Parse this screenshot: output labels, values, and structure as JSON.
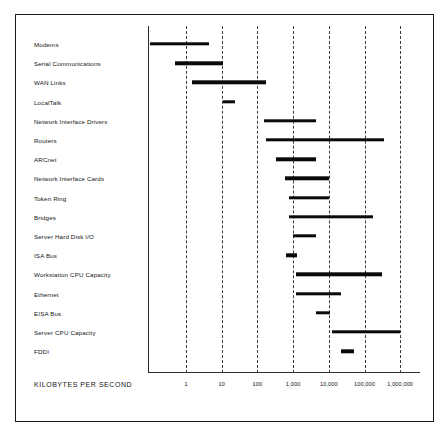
{
  "chart_data": {
    "type": "bar",
    "orientation": "horizontal",
    "subtype": "range-bar",
    "title": "",
    "xlabel": "KILOBYTES PER SECOND",
    "ylabel": "",
    "xscale": "log",
    "xlim": [
      0.1,
      2000000
    ],
    "grid": true,
    "legend": null,
    "xticks": [
      1,
      10,
      100,
      1000,
      10000,
      100000,
      1000000
    ],
    "xtick_labels": [
      "1",
      "10",
      "100",
      "1,000",
      "10,000",
      "100,000",
      "1,000,000"
    ],
    "categories": [
      "Modems",
      "Serial Communications",
      "WAN Links",
      "LocalTalk",
      "Network Interface Drivers",
      "Routers",
      "ARCnet",
      "Network Interface Cards",
      "Token Ring",
      "Bridges",
      "Server Hard Disk I/O",
      "ISA Bus",
      "Workstation CPU Capacity",
      "Ethernet",
      "EISA Bus",
      "Server CPU Capacity",
      "FDDI"
    ],
    "ranges": [
      {
        "category": "Modems",
        "low": 0.1,
        "high": 4.3
      },
      {
        "category": "Serial Communications",
        "low": 0.5,
        "high": 11
      },
      {
        "category": "WAN Links",
        "low": 1.5,
        "high": 170
      },
      {
        "category": "LocalTalk",
        "low": 11,
        "high": 24
      },
      {
        "category": "Network Interface Drivers",
        "low": 150,
        "high": 4500
      },
      {
        "category": "Routers",
        "low": 170,
        "high": 360000
      },
      {
        "category": "ARCnet",
        "low": 330,
        "high": 4500
      },
      {
        "category": "Network Interface Cards",
        "low": 600,
        "high": 10000
      },
      {
        "category": "Token Ring",
        "low": 750,
        "high": 10000
      },
      {
        "category": "Bridges",
        "low": 750,
        "high": 170000
      },
      {
        "category": "Server Hard Disk I/O",
        "low": 1000,
        "high": 4500
      },
      {
        "category": "ISA Bus",
        "low": 620,
        "high": 1300
      },
      {
        "category": "Workstation CPU Capacity",
        "low": 1200,
        "high": 300000
      },
      {
        "category": "Ethernet",
        "low": 1200,
        "high": 22000
      },
      {
        "category": "EISA Bus",
        "low": 4500,
        "high": 11000
      },
      {
        "category": "Server CPU Capacity",
        "low": 12000,
        "high": 1000000
      },
      {
        "category": "FDDI",
        "low": 22000,
        "high": 50000
      }
    ]
  }
}
